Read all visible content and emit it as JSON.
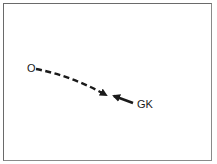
{
  "diagram": {
    "labels": {
      "origin": "O",
      "goalkeeper": "GK"
    },
    "colors": {
      "line": "#1a1a1a",
      "border": "#6a6a6a",
      "background": "#ffffff"
    },
    "paths": [
      {
        "id": "ball-path",
        "style": "dashed",
        "from": "O",
        "direction": "toward GK"
      },
      {
        "id": "goalkeeper-path",
        "style": "solid",
        "from": "GK",
        "direction": "toward ball"
      }
    ]
  }
}
